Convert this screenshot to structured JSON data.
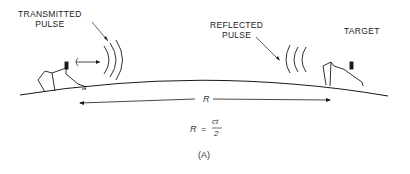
{
  "diagram": {
    "labels": {
      "transmitted_line1": "TRANSMITTED",
      "transmitted_line2": "PULSE",
      "reflected_line1": "REFLECTED",
      "reflected_line2": "PULSE",
      "target": "TARGET"
    },
    "range_label": "R",
    "equation": {
      "lhs": "R",
      "equals": "=",
      "numerator": "ct",
      "denominator": "2"
    },
    "caption": "(A)",
    "colors": {
      "ink": "#1a1a1a",
      "background": "#ffffff"
    }
  }
}
